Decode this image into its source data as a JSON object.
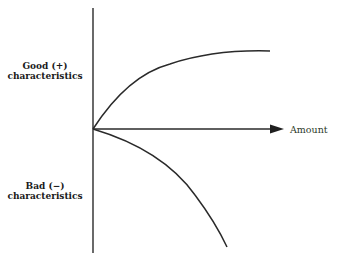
{
  "diagram": {
    "y_axis_positive_label": {
      "line1": "Good (+)",
      "line2": "characteristics"
    },
    "y_axis_negative_label": {
      "line1": "Bad (−)",
      "line2": "characteristics"
    },
    "x_axis_label": "Amount",
    "colors": {
      "stroke": "#2a2a2a",
      "text": "#1a1a1a",
      "amount_text": "#2d3a2a",
      "background": "#ffffff"
    },
    "curves": [
      {
        "name": "good-characteristics-curve",
        "shape": "concave rising, saturating"
      },
      {
        "name": "bad-characteristics-curve",
        "shape": "concave falling, accelerating"
      }
    ]
  }
}
